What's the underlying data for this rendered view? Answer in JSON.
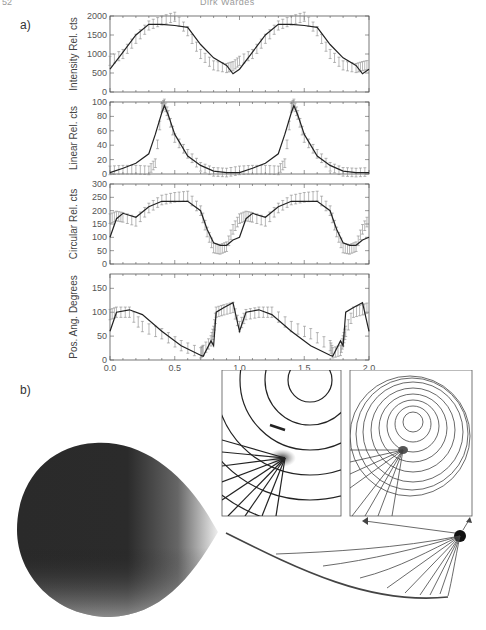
{
  "header": {
    "page_number": "52",
    "running_head": "Dirk Wardes"
  },
  "figure": {
    "panel_a_label": "a)",
    "panel_b_label": "b)"
  },
  "chart_data": [
    {
      "type": "line",
      "title": "Intensity",
      "ylabel": "Intensity Rel. cts",
      "xlabel": "",
      "xlim": [
        0.0,
        2.0
      ],
      "ylim": [
        0,
        2000
      ],
      "yticks": [
        0,
        500,
        1000,
        1500,
        2000
      ],
      "x": [
        0.0,
        0.1,
        0.2,
        0.3,
        0.4,
        0.5,
        0.6,
        0.7,
        0.8,
        0.9,
        0.95,
        1.0,
        1.1,
        1.2,
        1.3,
        1.4,
        1.5,
        1.6,
        1.7,
        1.8,
        1.9,
        1.95,
        2.0
      ],
      "series": [
        {
          "name": "model",
          "style": "solid",
          "values": [
            600,
            1050,
            1500,
            1780,
            1780,
            1750,
            1700,
            1250,
            900,
            700,
            480,
            600,
            1050,
            1500,
            1780,
            1780,
            1750,
            1700,
            1250,
            900,
            700,
            480,
            600
          ]
        },
        {
          "name": "observed",
          "style": "error-bars",
          "values": [
            820,
            1000,
            1400,
            1750,
            1880,
            1980,
            1600,
            1000,
            700,
            630,
            680,
            820,
            1000,
            1400,
            1750,
            1880,
            1980,
            1600,
            1000,
            700,
            630,
            680,
            720
          ]
        }
      ]
    },
    {
      "type": "line",
      "title": "Linear polarisation",
      "ylabel": "Linear Rel. cts",
      "xlim": [
        0.0,
        2.0
      ],
      "ylim": [
        0,
        100
      ],
      "yticks": [
        0,
        20,
        40,
        60,
        80,
        100
      ],
      "x": [
        0.0,
        0.1,
        0.2,
        0.3,
        0.35,
        0.4,
        0.42,
        0.45,
        0.5,
        0.6,
        0.7,
        0.8,
        0.9,
        1.0,
        1.1,
        1.2,
        1.3,
        1.35,
        1.4,
        1.42,
        1.45,
        1.5,
        1.6,
        1.7,
        1.8,
        1.9,
        2.0
      ],
      "series": [
        {
          "name": "model",
          "style": "solid",
          "values": [
            2,
            8,
            15,
            28,
            55,
            85,
            95,
            82,
            55,
            25,
            12,
            4,
            2,
            2,
            8,
            15,
            28,
            55,
            85,
            95,
            82,
            55,
            25,
            12,
            4,
            2,
            2
          ]
        },
        {
          "name": "observed",
          "style": "error-bars",
          "values": [
            5,
            6,
            6,
            5,
            15,
            92,
            98,
            82,
            50,
            28,
            10,
            3,
            2,
            5,
            6,
            6,
            5,
            15,
            92,
            98,
            82,
            50,
            28,
            10,
            3,
            2,
            3
          ]
        }
      ]
    },
    {
      "type": "line",
      "title": "Circular polarisation",
      "ylabel": "Circular Rel. cts",
      "xlim": [
        0.0,
        2.0
      ],
      "ylim": [
        0,
        300
      ],
      "yticks": [
        0,
        50,
        100,
        150,
        200,
        250,
        300
      ],
      "x": [
        0.0,
        0.05,
        0.1,
        0.2,
        0.3,
        0.4,
        0.5,
        0.6,
        0.7,
        0.75,
        0.8,
        0.85,
        0.9,
        0.95,
        1.0,
        1.05,
        1.1,
        1.2,
        1.3,
        1.4,
        1.5,
        1.6,
        1.7,
        1.75,
        1.8,
        1.85,
        1.9,
        1.95,
        2.0
      ],
      "series": [
        {
          "name": "model",
          "style": "solid",
          "values": [
            100,
            170,
            190,
            175,
            215,
            235,
            235,
            235,
            200,
            130,
            80,
            70,
            70,
            90,
            100,
            170,
            190,
            175,
            215,
            235,
            235,
            235,
            200,
            130,
            80,
            70,
            70,
            90,
            100
          ]
        },
        {
          "name": "observed",
          "style": "error-bars",
          "values": [
            170,
            180,
            175,
            160,
            210,
            240,
            250,
            255,
            200,
            120,
            60,
            55,
            65,
            130,
            170,
            180,
            175,
            160,
            210,
            240,
            250,
            255,
            200,
            120,
            60,
            55,
            65,
            130,
            170
          ]
        }
      ]
    },
    {
      "type": "line",
      "title": "Position angle",
      "ylabel": "Pos. Ang. Degrees",
      "xlabel": "Phase",
      "xlim": [
        0.0,
        2.0
      ],
      "ylim": [
        0,
        180
      ],
      "yticks": [
        0,
        50,
        100,
        150
      ],
      "xticks": [
        "0.0",
        "0.5",
        "1.0",
        "1.5",
        "2.0"
      ],
      "x": [
        0.0,
        0.05,
        0.15,
        0.25,
        0.4,
        0.55,
        0.7,
        0.72,
        0.78,
        0.8,
        0.82,
        0.88,
        0.95,
        1.0,
        1.05,
        1.15,
        1.25,
        1.4,
        1.55,
        1.7,
        1.72,
        1.78,
        1.8,
        1.82,
        1.88,
        1.95,
        2.0
      ],
      "series": [
        {
          "name": "model",
          "style": "solid",
          "values": [
            60,
            100,
            105,
            95,
            60,
            30,
            10,
            8,
            40,
            30,
            100,
            110,
            120,
            60,
            100,
            105,
            95,
            60,
            30,
            10,
            8,
            40,
            30,
            100,
            110,
            120,
            60
          ]
        },
        {
          "name": "observed",
          "style": "error-bars",
          "values": [
            95,
            100,
            100,
            70,
            55,
            30,
            15,
            20,
            40,
            60,
            100,
            105,
            110,
            70,
            95,
            100,
            100,
            70,
            55,
            30,
            15,
            20,
            40,
            60,
            100,
            105,
            110
          ]
        }
      ]
    }
  ],
  "panel_b": {
    "description": "Illustration: dark accretion spot map on star, two field-line inset views with arrows pointing from dot to insets, and field lines fanning from a dot to a curved trajectory"
  }
}
